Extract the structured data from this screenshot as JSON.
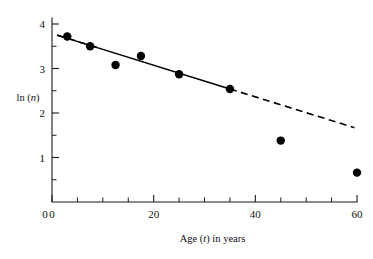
{
  "chart_data": {
    "type": "scatter",
    "title": "",
    "subtitle": "",
    "xlabel": "Age (t) in years",
    "xlabel_parts": {
      "pre": "Age (",
      "italic": "t",
      "post": ") in years"
    },
    "ylabel": "ln (n)",
    "ylabel_parts": {
      "pre": "ln (",
      "italic": "n",
      "post": ")"
    },
    "xlim": [
      0,
      60
    ],
    "ylim": [
      0,
      4
    ],
    "grid": false,
    "legend": false,
    "legend_position": "none",
    "x_ticks_major": [
      0,
      20,
      40,
      60
    ],
    "x_tick_labels": [
      "0",
      "20",
      "40",
      "60"
    ],
    "x_ticks_minor": [
      5,
      10,
      15,
      25,
      30,
      35,
      45,
      50,
      55
    ],
    "y_ticks_major": [
      1,
      2,
      3,
      4
    ],
    "y_tick_labels": [
      "1",
      "2",
      "3",
      "4"
    ],
    "y_ticks_minor": [
      0.5,
      1.5,
      2.5,
      3.5
    ],
    "points": [
      {
        "x": 3.0,
        "y": 3.72
      },
      {
        "x": 7.5,
        "y": 3.5
      },
      {
        "x": 12.5,
        "y": 3.08
      },
      {
        "x": 17.5,
        "y": 3.28
      },
      {
        "x": 25.0,
        "y": 2.87
      },
      {
        "x": 35.0,
        "y": 2.54
      },
      {
        "x": 45.0,
        "y": 1.38
      },
      {
        "x": 60.0,
        "y": 0.66
      }
    ],
    "point_marker": "filled-circle",
    "point_color": "#000000",
    "point_radius_px": 4.2,
    "fit_line": {
      "style_solid_segment": {
        "x0": 1.0,
        "y0": 3.75,
        "x1": 35.0,
        "y1": 2.54
      },
      "style_dashed_left": {
        "x0": 1.0,
        "y0": 3.75,
        "x1": 9.5,
        "y1": 3.45
      },
      "style_dashed_right": {
        "x0": 35.0,
        "y0": 2.54,
        "x1": 59.5,
        "y1": 1.67
      },
      "color": "#000000",
      "slope": -0.0356,
      "intercept": 3.786
    },
    "axis_color": "#1a1a1a",
    "background_color": "#ffffff"
  },
  "geometry": {
    "plot_left_px": 52,
    "plot_right_px": 357,
    "plot_bottom_px": 202,
    "plot_top_px": 24
  }
}
